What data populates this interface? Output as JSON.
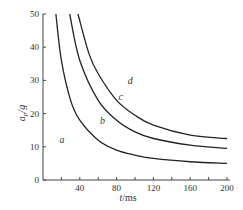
{
  "chart_data": {
    "type": "line",
    "title": "",
    "xlabel": "t/ms",
    "ylabel": "a_p/g",
    "xlim": [
      0,
      200
    ],
    "ylim": [
      0,
      50
    ],
    "x_ticks": [
      40,
      80,
      120,
      160,
      200
    ],
    "x_minor_step": 20,
    "y_ticks": [
      0,
      10,
      20,
      30,
      40,
      50
    ],
    "grid": false,
    "legend": "none; region labels placed on plot",
    "series": [
      {
        "name": "boundary a/b",
        "x": [
          14,
          20,
          30,
          40,
          60,
          80,
          100,
          120,
          160,
          200
        ],
        "y": [
          50,
          36,
          24,
          18,
          12,
          9,
          7.5,
          6.5,
          5.5,
          5
        ]
      },
      {
        "name": "boundary b/c",
        "x": [
          29,
          40,
          60,
          80,
          100,
          120,
          160,
          200
        ],
        "y": [
          50,
          36,
          24,
          18,
          14.5,
          12.5,
          10.5,
          9.5
        ]
      },
      {
        "name": "boundary c/d",
        "x": [
          38,
          50,
          60,
          80,
          100,
          120,
          160,
          200
        ],
        "y": [
          50,
          38,
          32,
          24,
          19.5,
          16.5,
          13.5,
          12.5
        ]
      }
    ],
    "annotations": [
      {
        "text": "a",
        "x": 18,
        "y": 11
      },
      {
        "text": "b",
        "x": 62,
        "y": 17
      },
      {
        "text": "c",
        "x": 82,
        "y": 24
      },
      {
        "text": "d",
        "x": 92,
        "y": 29
      }
    ]
  },
  "labels": {
    "xlabel_t": "t",
    "xlabel_unit": "/ms",
    "ylabel_a": "a",
    "ylabel_sub": "p",
    "ylabel_unit": "/g"
  }
}
